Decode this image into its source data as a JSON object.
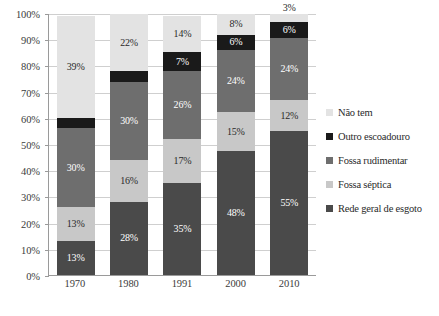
{
  "chart_data": {
    "type": "bar",
    "variant": "100% stacked column",
    "title": "",
    "subtitle": "",
    "xlabel": "",
    "ylabel": "",
    "categories": [
      "1970",
      "1980",
      "1991",
      "2000",
      "2010"
    ],
    "ylim": [
      0,
      100
    ],
    "ytick_labels": [
      "0%",
      "10%",
      "20%",
      "30%",
      "40%",
      "50%",
      "60%",
      "70%",
      "80%",
      "90%",
      "100%"
    ],
    "ytick_values": [
      0,
      10,
      20,
      30,
      40,
      50,
      60,
      70,
      80,
      90,
      100
    ],
    "grid": true,
    "grid_axis": "y",
    "legend_position": "right",
    "stack_order_bottom_to_top": [
      "Rede geral de esgoto",
      "Fossa séptica",
      "Fossa rudimentar",
      "Outro escoadouro",
      "Não tem"
    ],
    "series": [
      {
        "name": "Rede geral de esgoto",
        "color": "#4a4a4a",
        "values": [
          13,
          28,
          35,
          48,
          55
        ],
        "labels": [
          "13%",
          "28%",
          "35%",
          "48%",
          "55%"
        ]
      },
      {
        "name": "Fossa séptica",
        "color": "#c8c8c8",
        "values": [
          13,
          16,
          17,
          15,
          12
        ],
        "labels": [
          "13%",
          "16%",
          "17%",
          "15%",
          "12%"
        ]
      },
      {
        "name": "Fossa rudimentar",
        "color": "#6e6e6e",
        "values": [
          30,
          30,
          26,
          24,
          24
        ],
        "labels": [
          "30%",
          "30%",
          "26%",
          "24%",
          "24%"
        ]
      },
      {
        "name": "Outro escoadouro",
        "color": "#1a1a1a",
        "values": [
          4,
          4,
          7,
          6,
          6
        ],
        "labels": [
          "4%",
          "4%",
          "7%",
          "6%",
          "6%"
        ]
      },
      {
        "name": "Não tem",
        "color": "#e3e3e3",
        "values": [
          39,
          22,
          14,
          8,
          3
        ],
        "labels": [
          "39%",
          "22%",
          "14%",
          "8%",
          "3%"
        ]
      }
    ]
  },
  "legend": {
    "items": [
      {
        "label": "Não tem",
        "color": "#e3e3e3"
      },
      {
        "label": "Outro escoadouro",
        "color": "#1a1a1a"
      },
      {
        "label": "Fossa rudimentar",
        "color": "#6e6e6e"
      },
      {
        "label": "Fossa séptica",
        "color": "#c8c8c8"
      },
      {
        "label": "Rede geral de esgoto",
        "color": "#4a4a4a"
      }
    ]
  },
  "colors": {
    "nao_tem": "#e3e3e3",
    "outro_escoadouro": "#1a1a1a",
    "fossa_rudimentar": "#6e6e6e",
    "fossa_septica": "#c8c8c8",
    "rede_geral_de_esgoto": "#4a4a4a",
    "axis": "#9a9a9a",
    "gridline": "#cfcfcf",
    "text": "#2a2a2a",
    "background": "#ffffff"
  }
}
